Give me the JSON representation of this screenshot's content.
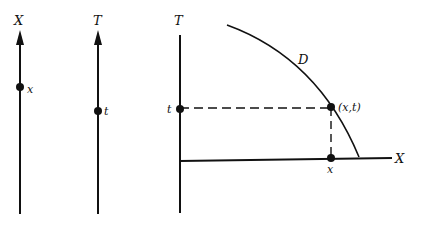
{
  "figure": {
    "panel1": {
      "axis_label": "X",
      "point_label": "x"
    },
    "panel2": {
      "axis_label": "T",
      "point_label": "t"
    },
    "panel3": {
      "vertical_axis_label": "T",
      "horizontal_axis_label": "X",
      "curve_label": "D",
      "t_label": "t",
      "x_label": "x",
      "point_label": "(x,t)"
    }
  },
  "colors": {
    "stroke": "#111111",
    "background": "#ffffff"
  }
}
